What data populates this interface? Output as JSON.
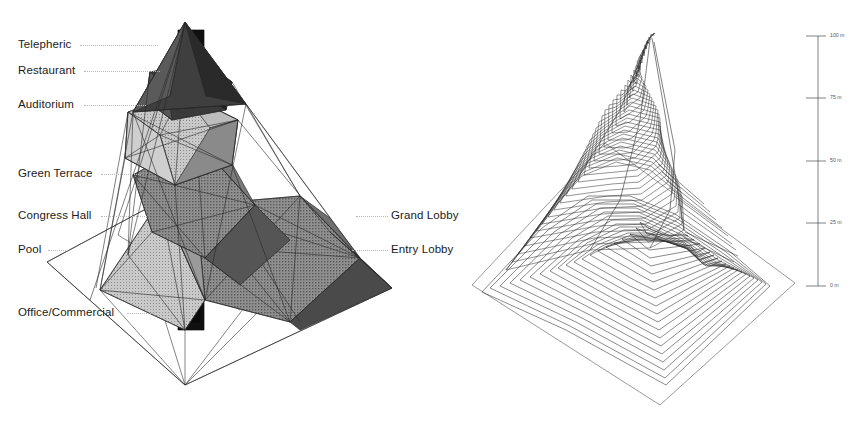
{
  "diagram": {
    "left_model": {
      "name": "faceted-tower-massing-model",
      "description": "Triangulated polyhedral tower with shaded facets over a flat quadrilateral site plane, pierced by a dark vertical core shaft"
    },
    "right_model": {
      "name": "stacked-contour-peak-model",
      "description": "Horizontal level-set contour slices stacked to form a peak over a square site plane"
    }
  },
  "labels_left": [
    {
      "text": "Telepheric",
      "x": 18,
      "y": 39,
      "leader_x": 80,
      "leader_w": 78,
      "leader_y": 45
    },
    {
      "text": "Restaurant",
      "x": 18,
      "y": 65,
      "leader_x": 84,
      "leader_w": 76,
      "leader_y": 71
    },
    {
      "text": "Auditorium",
      "x": 18,
      "y": 99,
      "leader_x": 84,
      "leader_w": 62,
      "leader_y": 105
    },
    {
      "text": "Green Terrace",
      "x": 18,
      "y": 168,
      "leader_x": 101,
      "leader_w": 40,
      "leader_y": 174
    },
    {
      "text": "Congress Hall",
      "x": 18,
      "y": 210,
      "leader_x": 101,
      "leader_w": 46,
      "leader_y": 216
    },
    {
      "text": "Pool",
      "x": 18,
      "y": 244,
      "leader_x": 48,
      "leader_w": 20,
      "leader_y": 250
    },
    {
      "text": "Office/Commercial",
      "x": 18,
      "y": 307,
      "leader_x": 127,
      "leader_w": 28,
      "leader_y": 313
    }
  ],
  "labels_right": [
    {
      "text": "Grand Lobby",
      "x": 391,
      "y": 210,
      "leader_x": 356,
      "leader_w": 32,
      "leader_y": 216
    },
    {
      "text": "Entry Lobby",
      "x": 391,
      "y": 244,
      "leader_x": 352,
      "leader_w": 36,
      "leader_y": 250
    }
  ],
  "scale_bar": {
    "name": "height-scale-bar",
    "axis_x": 818,
    "top_y": 36,
    "bottom_y": 286,
    "ticks": [
      {
        "label": "100 m",
        "y": 36
      },
      {
        "label": "75 m",
        "y": 98
      },
      {
        "label": "50 m",
        "y": 161
      },
      {
        "label": "25 m",
        "y": 223
      },
      {
        "label": "0 m",
        "y": 286
      }
    ],
    "unit": "m",
    "max_value": 100,
    "min_value": 0,
    "interval": 25
  },
  "colors": {
    "line": "#2a2a2a",
    "leader": "#b9b9b9",
    "text": "#1b1b1b",
    "scale_text": "#555555",
    "facet_light": "#d8d8d8",
    "facet_mid": "#a8a8a8",
    "facet_dark": "#6e6e6e",
    "facet_darker": "#3c3c3c",
    "core": "#101010",
    "background": "#ffffff"
  }
}
